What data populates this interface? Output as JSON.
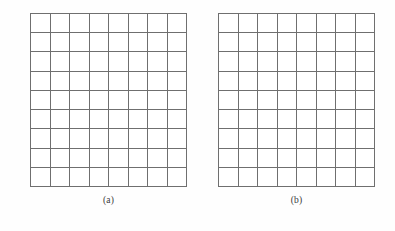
{
  "figure": {
    "type": "grid-pair-figure",
    "background_color": "#fefefe",
    "line_color": "#6f6f6f",
    "label_color": "#3a3a3a",
    "panels": [
      {
        "id": "a",
        "label": "(a)",
        "grid": {
          "columns": 8,
          "rows": 9,
          "cells_total": 72,
          "filled": false,
          "cell_contents": []
        }
      },
      {
        "id": "b",
        "label": "(b)",
        "grid": {
          "columns": 8,
          "rows": 9,
          "cells_total": 72,
          "filled": false,
          "cell_contents": []
        }
      }
    ]
  }
}
